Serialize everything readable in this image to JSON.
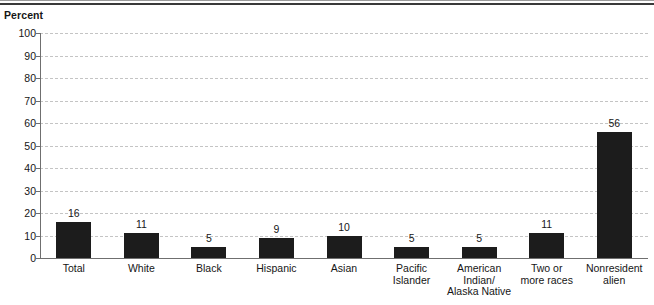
{
  "chart_data": {
    "type": "bar",
    "title": "",
    "ylabel": "Percent",
    "xlabel": "",
    "ylim": [
      0,
      100
    ],
    "yticks": [
      0,
      10,
      20,
      30,
      40,
      50,
      60,
      70,
      80,
      90,
      100
    ],
    "ytick_labels": [
      "0",
      "10",
      "20",
      "30",
      "40",
      "50",
      "60",
      "70",
      "80",
      "90",
      "100"
    ],
    "grid": true,
    "grid_style": "dashed-horizontal",
    "legend": "none",
    "categories": [
      "Total",
      "White",
      "Black",
      "Hispanic",
      "Asian",
      "Pacific\nIslander",
      "American Indian/\nAlaska Native",
      "Two or\nmore races",
      "Nonresident\nalien"
    ],
    "values": [
      16,
      11,
      5,
      9,
      10,
      5,
      5,
      11,
      56
    ],
    "data_labels": [
      "16",
      "11",
      "5",
      "9",
      "10",
      "5",
      "5",
      "11",
      "56"
    ],
    "bar_color": "#1c1c1c",
    "grid_color": "#c4c4c4",
    "axis_color": "#6f6f6f",
    "text_color": "#161616"
  }
}
